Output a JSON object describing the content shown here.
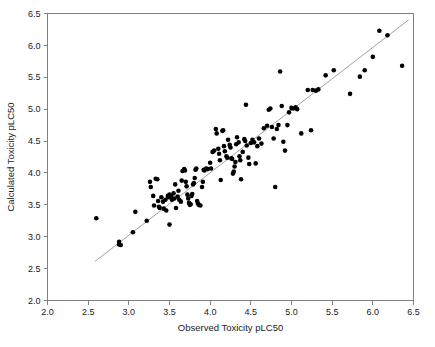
{
  "chart_data": {
    "type": "scatter",
    "title": "",
    "xlabel": "Observed Toxicity pLC50",
    "ylabel": "Calculated Toxicity pLC50",
    "xlim": [
      2.0,
      6.5
    ],
    "ylim": [
      2.0,
      6.5
    ],
    "xticks": [
      "2.0",
      "2.5",
      "3.0",
      "3.5",
      "4.0",
      "4.5",
      "5.0",
      "5.5",
      "6.0",
      "6.5"
    ],
    "yticks": [
      "2.0",
      "2.5",
      "3.0",
      "3.5",
      "4.0",
      "4.5",
      "5.0",
      "5.5",
      "6.0",
      "6.5"
    ],
    "xtick_values": [
      2.0,
      2.5,
      3.0,
      3.5,
      4.0,
      4.5,
      5.0,
      5.5,
      6.0,
      6.5
    ],
    "ytick_values": [
      2.0,
      2.5,
      3.0,
      3.5,
      4.0,
      4.5,
      5.0,
      5.5,
      6.0,
      6.5
    ],
    "grid": false,
    "legend": null,
    "marker_color": "#000000",
    "marker_size": 2.3,
    "fit_line": {
      "label": "identity / regression line",
      "color": "#8a8a8a",
      "x0": 2.58,
      "y0": 2.61,
      "x1": 6.44,
      "y1": 6.4
    },
    "series": [
      {
        "name": "Observed vs Calculated Toxicity",
        "points": [
          [
            2.6,
            3.29
          ],
          [
            2.88,
            2.92
          ],
          [
            2.88,
            2.88
          ],
          [
            2.9,
            2.87
          ],
          [
            3.05,
            3.07
          ],
          [
            3.08,
            3.39
          ],
          [
            3.22,
            3.25
          ],
          [
            3.26,
            3.86
          ],
          [
            3.27,
            3.78
          ],
          [
            3.3,
            3.64
          ],
          [
            3.31,
            3.49
          ],
          [
            3.33,
            3.91
          ],
          [
            3.35,
            3.9
          ],
          [
            3.36,
            3.56
          ],
          [
            3.37,
            3.47
          ],
          [
            3.38,
            3.45
          ],
          [
            3.4,
            3.62
          ],
          [
            3.42,
            3.55
          ],
          [
            3.43,
            3.44
          ],
          [
            3.45,
            3.58
          ],
          [
            3.46,
            3.41
          ],
          [
            3.48,
            3.64
          ],
          [
            3.49,
            3.62
          ],
          [
            3.5,
            3.66
          ],
          [
            3.5,
            3.19
          ],
          [
            3.52,
            3.63
          ],
          [
            3.53,
            3.58
          ],
          [
            3.55,
            3.68
          ],
          [
            3.56,
            3.6
          ],
          [
            3.57,
            3.82
          ],
          [
            3.58,
            3.45
          ],
          [
            3.6,
            3.63
          ],
          [
            3.61,
            3.72
          ],
          [
            3.62,
            3.58
          ],
          [
            3.64,
            3.55
          ],
          [
            3.65,
            3.88
          ],
          [
            3.66,
            4.03
          ],
          [
            3.68,
            4.06
          ],
          [
            3.69,
            4.04
          ],
          [
            3.7,
            3.86
          ],
          [
            3.71,
            3.79
          ],
          [
            3.72,
            3.66
          ],
          [
            3.73,
            3.6
          ],
          [
            3.74,
            3.53
          ],
          [
            3.75,
            3.5
          ],
          [
            3.76,
            3.51
          ],
          [
            3.77,
            3.64
          ],
          [
            3.78,
            3.67
          ],
          [
            3.79,
            3.82
          ],
          [
            3.8,
            3.84
          ],
          [
            3.81,
            3.92
          ],
          [
            3.82,
            4.05
          ],
          [
            3.83,
            4.07
          ],
          [
            3.84,
            3.56
          ],
          [
            3.85,
            3.52
          ],
          [
            3.86,
            3.5
          ],
          [
            3.88,
            3.49
          ],
          [
            3.9,
            3.78
          ],
          [
            3.91,
            3.86
          ],
          [
            3.92,
            4.05
          ],
          [
            3.93,
            4.04
          ],
          [
            3.95,
            4.07
          ],
          [
            3.97,
            4.06
          ],
          [
            4.0,
            4.16
          ],
          [
            4.01,
            4.07
          ],
          [
            4.03,
            4.33
          ],
          [
            4.05,
            4.35
          ],
          [
            4.07,
            4.69
          ],
          [
            4.08,
            4.62
          ],
          [
            4.1,
            4.38
          ],
          [
            4.11,
            4.3
          ],
          [
            4.12,
            4.2
          ],
          [
            4.13,
            3.89
          ],
          [
            4.15,
            4.66
          ],
          [
            4.16,
            4.67
          ],
          [
            4.17,
            4.42
          ],
          [
            4.18,
            4.34
          ],
          [
            4.2,
            4.26
          ],
          [
            4.21,
            4.24
          ],
          [
            4.22,
            4.52
          ],
          [
            4.24,
            4.44
          ],
          [
            4.25,
            4.4
          ],
          [
            4.26,
            4.23
          ],
          [
            4.27,
            4.22
          ],
          [
            4.28,
            3.99
          ],
          [
            4.29,
            4.02
          ],
          [
            4.3,
            4.1
          ],
          [
            4.31,
            4.17
          ],
          [
            4.32,
            4.45
          ],
          [
            4.33,
            4.56
          ],
          [
            4.35,
            4.48
          ],
          [
            4.36,
            4.26
          ],
          [
            4.37,
            4.2
          ],
          [
            4.38,
            3.9
          ],
          [
            4.4,
            4.33
          ],
          [
            4.42,
            4.53
          ],
          [
            4.43,
            4.5
          ],
          [
            4.44,
            5.07
          ],
          [
            4.45,
            4.43
          ],
          [
            4.47,
            4.24
          ],
          [
            4.48,
            4.14
          ],
          [
            4.5,
            4.47
          ],
          [
            4.52,
            4.52
          ],
          [
            4.54,
            4.48
          ],
          [
            4.56,
            4.15
          ],
          [
            4.58,
            4.42
          ],
          [
            4.6,
            4.54
          ],
          [
            4.63,
            4.46
          ],
          [
            4.66,
            4.7
          ],
          [
            4.7,
            4.74
          ],
          [
            4.72,
            4.99
          ],
          [
            4.74,
            5.01
          ],
          [
            4.76,
            4.72
          ],
          [
            4.78,
            4.54
          ],
          [
            4.8,
            3.78
          ],
          [
            4.82,
            4.69
          ],
          [
            4.84,
            4.75
          ],
          [
            4.86,
            5.59
          ],
          [
            4.88,
            5.05
          ],
          [
            4.9,
            4.49
          ],
          [
            4.92,
            4.35
          ],
          [
            4.95,
            4.75
          ],
          [
            4.97,
            4.95
          ],
          [
            5.0,
            5.02
          ],
          [
            5.02,
            5.01
          ],
          [
            5.05,
            5.03
          ],
          [
            5.07,
            5.0
          ],
          [
            5.12,
            4.62
          ],
          [
            5.2,
            5.3
          ],
          [
            5.24,
            4.67
          ],
          [
            5.26,
            5.3
          ],
          [
            5.3,
            5.29
          ],
          [
            5.33,
            5.31
          ],
          [
            5.42,
            5.53
          ],
          [
            5.52,
            5.61
          ],
          [
            5.72,
            5.24
          ],
          [
            5.84,
            5.51
          ],
          [
            5.9,
            5.61
          ],
          [
            6.0,
            5.82
          ],
          [
            6.08,
            6.23
          ],
          [
            6.18,
            6.16
          ],
          [
            6.36,
            5.68
          ]
        ]
      }
    ]
  },
  "axis": {
    "x_title": "Observed Toxicity pLC50",
    "y_title": "Calculated Toxicity pLC50"
  }
}
